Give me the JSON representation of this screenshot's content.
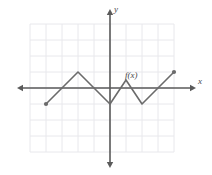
{
  "figure": {
    "labels": {
      "y_axis": "y",
      "x_axis": "x",
      "function": "f(x)"
    },
    "colors": {
      "grid": "#e8e8ec",
      "axis": "#5a5a5a",
      "curve": "#6b6b6b",
      "background": "#ffffff"
    }
  },
  "chart_data": {
    "type": "line",
    "title": "",
    "xlabel": "x",
    "ylabel": "y",
    "annotations": [
      "f(x)"
    ],
    "grid": true,
    "legend": null,
    "axis_arrows": [
      "left",
      "right",
      "up",
      "down"
    ],
    "xlim": [
      -5,
      4
    ],
    "ylim": [
      -4,
      4
    ],
    "gridlines": {
      "x_step": 1,
      "y_step": 1
    },
    "series": [
      {
        "name": "f(x)",
        "points": [
          {
            "x": -4,
            "y": -1
          },
          {
            "x": -2,
            "y": 1
          },
          {
            "x": 0,
            "y": -1
          },
          {
            "x": 1,
            "y": 0.5
          },
          {
            "x": 2,
            "y": -1
          },
          {
            "x": 4,
            "y": 1
          }
        ],
        "endpoint_markers": [
          {
            "x": -4,
            "y": -1
          },
          {
            "x": 4,
            "y": 1
          }
        ],
        "style": "piecewise-linear"
      }
    ]
  }
}
